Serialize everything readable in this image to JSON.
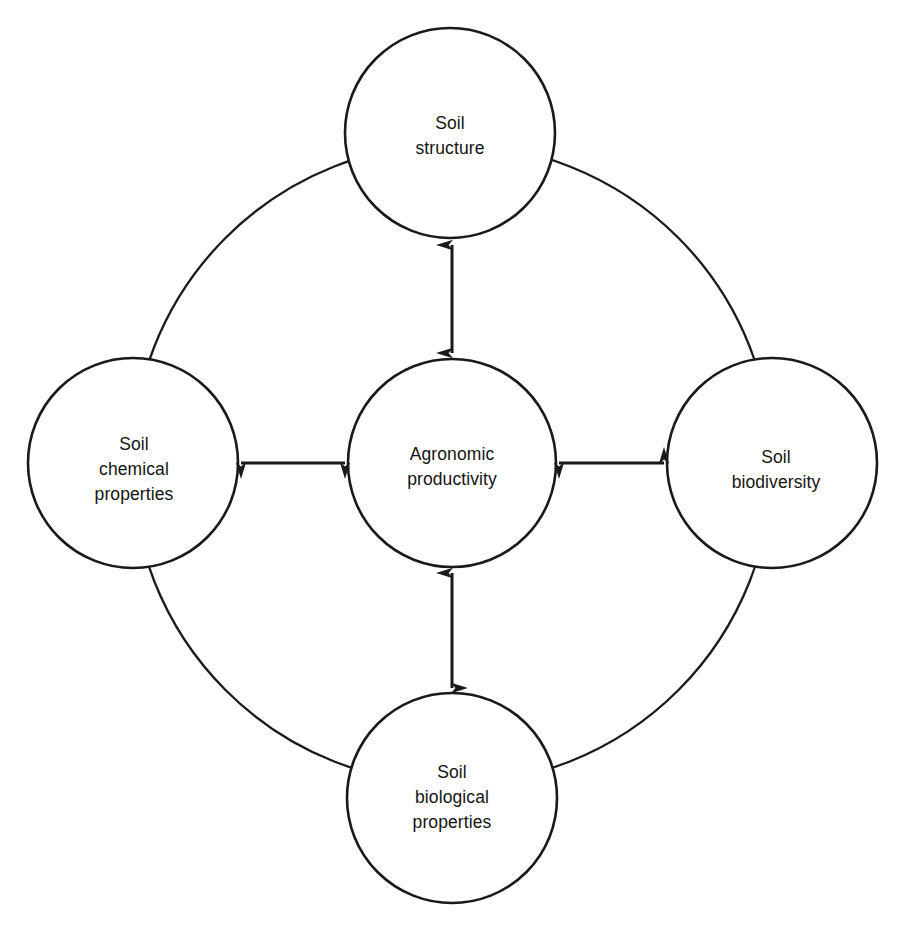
{
  "diagram": {
    "type": "concept-map",
    "background_color": "#ffffff",
    "stroke_color": "#1a1a1a",
    "text_color": "#141414",
    "circle_radius": 105,
    "outer_ring": {
      "shape": "circle",
      "center": [
        452,
        464
      ],
      "radius": 320,
      "note": "large ring arc connecting the four peripheral circles, hidden behind each circle"
    },
    "nodes": [
      {
        "id": "soil-structure",
        "label": "Soil\nstructure",
        "label_lines": [
          "Soil",
          "structure"
        ],
        "position": "top",
        "center": [
          450,
          133
        ],
        "radius": 105,
        "label_center": [
          450,
          136
        ]
      },
      {
        "id": "soil-chemical-properties",
        "label": "Soil\nchemical\nproperties",
        "label_lines": [
          "Soil",
          "chemical",
          "properties"
        ],
        "position": "left",
        "center": [
          133,
          463
        ],
        "radius": 105,
        "label_center": [
          134,
          469
        ]
      },
      {
        "id": "agronomic-productivity",
        "label": "Agronomic\nproductivity",
        "label_lines": [
          "Agronomic",
          "productivity"
        ],
        "position": "center",
        "center": [
          452,
          463
        ],
        "radius": 104,
        "label_center": [
          452,
          467
        ]
      },
      {
        "id": "soil-biodiversity",
        "label": "Soil\nbiodiversity",
        "label_lines": [
          "Soil",
          "biodiversity"
        ],
        "position": "right",
        "center": [
          772,
          463
        ],
        "radius": 105,
        "label_center": [
          776,
          470
        ]
      },
      {
        "id": "soil-biological-properties",
        "label": "Soil\nbiological\nproperties",
        "label_lines": [
          "Soil",
          "biological",
          "properties"
        ],
        "position": "bottom",
        "center": [
          452,
          798
        ],
        "radius": 105,
        "label_center": [
          452,
          797
        ]
      }
    ],
    "connectors": [
      {
        "id": "arrow-center-top",
        "from": "agronomic-productivity",
        "to": "soil-structure",
        "style": "double-headed-arrow",
        "orientation": "vertical",
        "x": 452,
        "y1": 354,
        "y2": 243
      },
      {
        "id": "arrow-center-left",
        "from": "agronomic-productivity",
        "to": "soil-chemical-properties",
        "style": "double-headed-arrow",
        "orientation": "horizontal",
        "y": 463,
        "x1": 345,
        "x2": 240
      },
      {
        "id": "arrow-center-right",
        "from": "agronomic-productivity",
        "to": "soil-biodiversity",
        "style": "double-headed-arrow",
        "orientation": "horizontal",
        "y": 463,
        "x1": 558,
        "x2": 665
      },
      {
        "id": "arrow-center-bottom",
        "from": "agronomic-productivity",
        "to": "soil-biological-properties",
        "style": "double-headed-arrow",
        "orientation": "vertical",
        "x": 452,
        "y1": 571,
        "y2": 690
      }
    ]
  }
}
